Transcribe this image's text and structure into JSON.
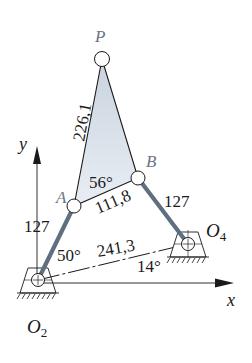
{
  "diagram": {
    "type": "four-bar linkage with coupler point",
    "colors": {
      "link": "#5f6f80",
      "line": "#1a1a1a",
      "coupler_fill_top": "#c9d3de",
      "coupler_fill_bottom": "#e9eef4",
      "point_label": "#6b7585",
      "background": "#ffffff"
    },
    "points": {
      "O2": {
        "label": "O",
        "sub": "2",
        "x": 38,
        "y": 280
      },
      "O4": {
        "label": "O",
        "sub": "4",
        "x": 188,
        "y": 244
      },
      "A": {
        "label": "A",
        "x": 74,
        "y": 206
      },
      "B": {
        "label": "B",
        "x": 138,
        "y": 178
      },
      "P": {
        "label": "P",
        "x": 102,
        "y": 59
      }
    },
    "axes": {
      "x_label": "x",
      "y_label": "y"
    },
    "dimensions": {
      "AP": "226,1",
      "AB": "111,8",
      "O2A": "127",
      "O4B": "127",
      "O2O4": "241,3"
    },
    "angles": {
      "coupler_angle_A": "56°",
      "crank_angle": "50°",
      "ground_angle": "14°"
    }
  }
}
